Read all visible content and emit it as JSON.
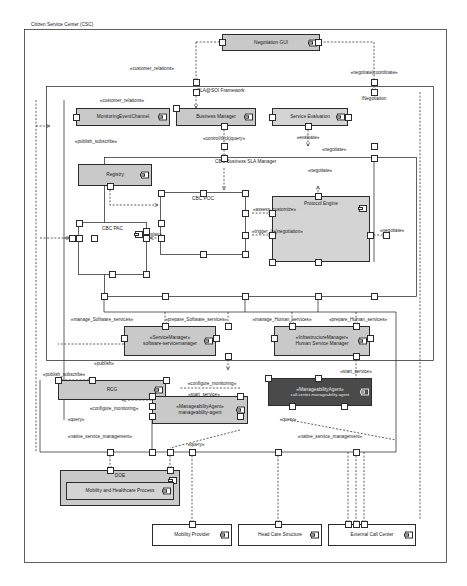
{
  "diagram": {
    "title": "Citizen Service Center (CSC)",
    "frames": [
      {
        "id": "csc",
        "label": "Citizen Service Center (CSC)"
      },
      {
        "id": "slasoi",
        "label": "SLA@SOI Framework"
      },
      {
        "id": "cbcsla",
        "label": "CBC Business SLA Manager"
      }
    ]
  },
  "components": [
    {
      "id": "negotiation-gui",
      "name": "Negotiation GUI",
      "fill": "grey"
    },
    {
      "id": "monitoring-event-channel",
      "name": "MonitoringEventChannel",
      "fill": "grey"
    },
    {
      "id": "business-manager",
      "name": "Business Manager",
      "fill": "grey"
    },
    {
      "id": "service-evaluation",
      "name": "Service Evaluation",
      "fill": "grey2"
    },
    {
      "id": "registry",
      "name": "Registry",
      "fill": "grey"
    },
    {
      "id": "cbc-poc",
      "name": "CBC POC",
      "fill": "white"
    },
    {
      "id": "cbc-pac",
      "name": "CBC PAC",
      "fill": "white"
    },
    {
      "id": "protocol-engine",
      "name": "Protocol Engine",
      "fill": "grey2"
    },
    {
      "id": "service-manager",
      "name": "«ServiceManager»",
      "name2": "software-servicemanager",
      "fill": "grey"
    },
    {
      "id": "human-service-manager",
      "name": "«InfrastructureManager»",
      "name2": "Human Service Manager",
      "fill": "grey"
    },
    {
      "id": "rcg",
      "name": "RCG",
      "fill": "grey"
    },
    {
      "id": "manageability-agent",
      "name": "«ManageabilityAgent»",
      "name2": "manageability-agent",
      "fill": "grey"
    },
    {
      "id": "call-center-agent",
      "name": "«ManageabilityAgent»",
      "name2": "call-center-manageability-agent",
      "fill": "dark"
    },
    {
      "id": "doe",
      "name": "DOE",
      "fill": "grey"
    },
    {
      "id": "mobility-healthcare-process",
      "name": "Mobility and Healthcare Process",
      "fill": "grey2"
    },
    {
      "id": "mobility-provider",
      "name": "Mobility Provider",
      "fill": "white"
    },
    {
      "id": "head-care-structure",
      "name": "Head Care Structure",
      "fill": "white"
    },
    {
      "id": "external-call-center",
      "name": "External Call Center",
      "fill": "white"
    }
  ],
  "stereotypes": [
    {
      "id": "customer-relations-top",
      "text": "«customer_relations»"
    },
    {
      "id": "customer-relations-mid",
      "text": "«customer_relations»"
    },
    {
      "id": "negotiate-coordinate",
      "text": "«negotiate|coordinate»"
    },
    {
      "id": "inegotiation",
      "text": "INegotiation"
    },
    {
      "id": "control-click-query",
      "text": "«control/tl(ck)query»"
    },
    {
      "id": "publish-subscribe-top",
      "text": "«publish_subscribe»"
    },
    {
      "id": "publish-subscribe-mid",
      "text": "«publish_subscribe»"
    },
    {
      "id": "evaluate",
      "text": "«evaluate»"
    },
    {
      "id": "negotiate-top",
      "text": "«negotiate»"
    },
    {
      "id": "negotiate-mid",
      "text": "«negotiate»"
    },
    {
      "id": "negotiate-right",
      "text": "«negotiate»"
    },
    {
      "id": "plan",
      "text": "«plan»"
    },
    {
      "id": "assess-customize",
      "text": "«assess_customize»"
    },
    {
      "id": "trigger-renegotiation",
      "text": "«trigger_(re)negotiation»"
    },
    {
      "id": "manage-software-services",
      "text": "«manage_Software_services»"
    },
    {
      "id": "prepare-software-services",
      "text": "«prepare_Software_services»"
    },
    {
      "id": "manage-human-services",
      "text": "«manage_Human_services»"
    },
    {
      "id": "prepare-human-services",
      "text": "«prepare_Human_services»"
    },
    {
      "id": "publish",
      "text": "«publish»"
    },
    {
      "id": "configure-monitoring-right",
      "text": "«configure_monitoring»"
    },
    {
      "id": "configure-monitoring-left",
      "text": "«configure_monitoring»"
    },
    {
      "id": "start-service-left",
      "text": "«start_service»"
    },
    {
      "id": "start-service-right",
      "text": "«start_service»"
    },
    {
      "id": "query-left",
      "text": "«query»"
    },
    {
      "id": "query-mid",
      "text": "«query»"
    },
    {
      "id": "query-right",
      "text": "«query»"
    },
    {
      "id": "native-service-management-left",
      "text": "«native_service_management»"
    },
    {
      "id": "native-service-management-right",
      "text": "«native_service_management»"
    }
  ]
}
